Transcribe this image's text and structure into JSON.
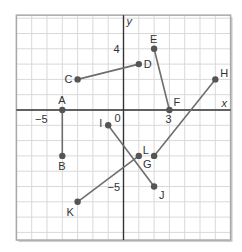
{
  "axes": {
    "x_label": "x",
    "y_label": "y",
    "origin_label": "0",
    "x_tick_labels": [
      {
        "value": -5,
        "label": "−5"
      },
      {
        "value": 3,
        "label": "3"
      }
    ],
    "y_tick_labels": [
      {
        "value": 4,
        "label": "4"
      },
      {
        "value": -5,
        "label": "−5"
      }
    ],
    "x_range": [
      -7,
      7
    ],
    "y_range": [
      -8.5,
      6.2
    ]
  },
  "points": [
    {
      "name": "A",
      "x": -4,
      "y": 0
    },
    {
      "name": "B",
      "x": -4,
      "y": -3
    },
    {
      "name": "C",
      "x": -3,
      "y": 2
    },
    {
      "name": "D",
      "x": 1,
      "y": 3
    },
    {
      "name": "E",
      "x": 2,
      "y": 4
    },
    {
      "name": "F",
      "x": 3,
      "y": 0
    },
    {
      "name": "G",
      "x": 2,
      "y": -3
    },
    {
      "name": "H",
      "x": 6,
      "y": 2
    },
    {
      "name": "I",
      "x": -1,
      "y": -1
    },
    {
      "name": "J",
      "x": 2,
      "y": -5
    },
    {
      "name": "K",
      "x": -3,
      "y": -6
    },
    {
      "name": "L",
      "x": 1,
      "y": -3
    }
  ],
  "segments": [
    [
      "A",
      "B"
    ],
    [
      "C",
      "D"
    ],
    [
      "E",
      "F"
    ],
    [
      "G",
      "H"
    ],
    [
      "I",
      "J"
    ],
    [
      "K",
      "L"
    ]
  ],
  "colors": {
    "grid": "#d9d9d9",
    "axis": "#333333",
    "segment": "#6e6e6e",
    "point": "#555555",
    "border": "#a8a8a8"
  }
}
